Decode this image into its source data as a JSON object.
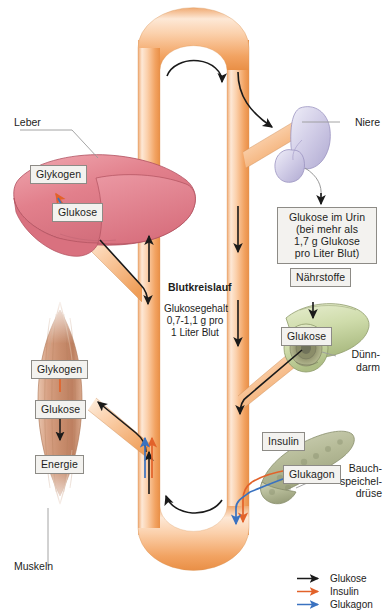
{
  "diagram": {
    "organs": {
      "liver": {
        "label": "Leber"
      },
      "kidney": {
        "label": "Niere"
      },
      "intestine": {
        "label": "Dünn-\ndarm"
      },
      "pancreas": {
        "label": "Bauch-\nspeichel-\ndrüse"
      },
      "muscle": {
        "label": "Muskeln"
      }
    },
    "chips": {
      "liver_glycogen": "Glykogen",
      "liver_glucose": "Glukose",
      "kidney_note": "Glukose im Urin\n(bei mehr als\n1,7 g Glukose\npro Liter Blut)",
      "nutrients": "Nährstoffe",
      "intestine_glucose": "Glukose",
      "pancreas_insulin": "Insulin",
      "pancreas_glucagon": "Glukagon",
      "muscle_glycogen": "Glykogen",
      "muscle_glucose": "Glukose",
      "muscle_energy": "Energie"
    },
    "bloodstream": {
      "title": "Blutkreislauf",
      "subtitle_line1": "Glukosegehalt",
      "subtitle_line2": "0,7-1,1 g pro",
      "subtitle_line3": "1 Liter Blut"
    },
    "legend": {
      "items": [
        {
          "label": "Glukose",
          "color": "#1a1a1a"
        },
        {
          "label": "Insulin",
          "color": "#e2622a"
        },
        {
          "label": "Glukagon",
          "color": "#3a72c0"
        }
      ]
    },
    "colors": {
      "vessel_light": "#fbe0c8",
      "vessel_mid": "#f7b97f",
      "vessel_dark": "#ef9a53",
      "liver": "#e2808c",
      "kidney": "#cfcbe6",
      "intestine": "#cdd7a8",
      "pancreas": "#b8bd9a",
      "muscle": "#c98e6e",
      "glucose_arrow": "#1a1a1a",
      "insulin_arrow": "#e2622a",
      "glucagon_arrow": "#3a72c0",
      "leader_line": "#9a9a9a",
      "chip_bg": "#f3f2ef",
      "chip_border": "#8d8b86",
      "text": "#1d1d1b"
    }
  }
}
